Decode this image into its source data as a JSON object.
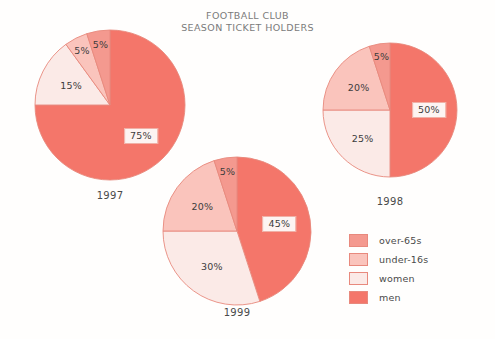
{
  "title": "FOOTBALL CLUB\nSEASON TICKET HOLDERS",
  "colors": {
    "men": "#f4766a",
    "over_65s": "#f4998f",
    "under_16s": "#fac4bc",
    "women": "#fbeae7",
    "stroke": "#e8897d",
    "text": "#4a4a4a",
    "background": "#fffefd"
  },
  "legend": {
    "items": [
      {
        "label": "over-65s",
        "color": "#f4998f"
      },
      {
        "label": "under-16s",
        "color": "#fac4bc"
      },
      {
        "label": "women",
        "color": "#fbeae7"
      },
      {
        "label": "men",
        "color": "#f4766a"
      }
    ]
  },
  "chart_data": {
    "type": "pie",
    "title": "FOOTBALL CLUB SEASON TICKET HOLDERS",
    "categories": [
      "men",
      "women",
      "under-16s",
      "over-65s"
    ],
    "units": "%",
    "legend_position": "bottom-right",
    "grid": false,
    "charts": [
      {
        "name": "1997",
        "year_label": "1997",
        "values": [
          75,
          15,
          5,
          5
        ],
        "slices": [
          {
            "category": "men",
            "value": 75,
            "label": "75%",
            "color": "#f4766a",
            "boxed": true
          },
          {
            "category": "women",
            "value": 15,
            "label": "15%",
            "color": "#fbeae7",
            "boxed": false
          },
          {
            "category": "under-16s",
            "value": 5,
            "label": "5%",
            "color": "#fac4bc",
            "boxed": false
          },
          {
            "category": "over-65s",
            "value": 5,
            "label": "5%",
            "color": "#f4998f",
            "boxed": false
          }
        ]
      },
      {
        "name": "1998",
        "year_label": "1998",
        "values": [
          50,
          25,
          20,
          5
        ],
        "slices": [
          {
            "category": "men",
            "value": 50,
            "label": "50%",
            "color": "#f4766a",
            "boxed": true
          },
          {
            "category": "women",
            "value": 25,
            "label": "25%",
            "color": "#fbeae7",
            "boxed": false
          },
          {
            "category": "under-16s",
            "value": 20,
            "label": "20%",
            "color": "#fac4bc",
            "boxed": false
          },
          {
            "category": "over-65s",
            "value": 5,
            "label": "5%",
            "color": "#f4998f",
            "boxed": false
          }
        ]
      },
      {
        "name": "1999",
        "year_label": "1999",
        "values": [
          45,
          30,
          20,
          5
        ],
        "slices": [
          {
            "category": "men",
            "value": 45,
            "label": "45%",
            "color": "#f4766a",
            "boxed": true
          },
          {
            "category": "women",
            "value": 30,
            "label": "30%",
            "color": "#fbeae7",
            "boxed": false
          },
          {
            "category": "under-16s",
            "value": 20,
            "label": "20%",
            "color": "#fac4bc",
            "boxed": false
          },
          {
            "category": "over-65s",
            "value": 5,
            "label": "5%",
            "color": "#f4998f",
            "boxed": false
          }
        ]
      }
    ]
  },
  "layout": {
    "pies": [
      {
        "cx": 110,
        "cy": 105,
        "r": 75,
        "year_top": 190,
        "label_radius_factor": 0.58
      },
      {
        "cx": 390,
        "cy": 110,
        "r": 67,
        "year_top": 196,
        "label_radius_factor": 0.58
      },
      {
        "cx": 237,
        "cy": 231,
        "r": 74,
        "year_top": 307,
        "label_radius_factor": 0.58
      }
    ]
  }
}
